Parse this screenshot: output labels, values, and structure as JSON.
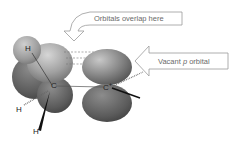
{
  "diagram": {
    "callouts": {
      "overlap": "Orbitals overlap here",
      "vacant_prefix": "Vacant ",
      "vacant_italic": "p",
      "vacant_suffix": " orbital"
    },
    "atoms": {
      "h_top": "H",
      "c_left": "C",
      "c_right": "C",
      "c_right_charge": "+",
      "h_left": "H",
      "h_bottom": "H"
    },
    "colors": {
      "orbital_dark": "#5e5e5e",
      "orbital_mid": "#8a8a8a",
      "orbital_light": "#c4c4c4",
      "h_sphere": "#a8a8a8",
      "arrow_stroke": "#9a9a9a",
      "text": "#6a6a6a"
    }
  }
}
